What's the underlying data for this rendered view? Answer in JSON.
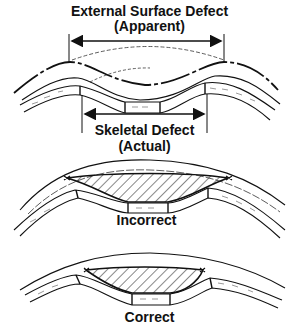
{
  "figure": {
    "panels": [
      {
        "id": "defect",
        "labels": {
          "external_title": "External Surface Defect",
          "external_sub": "(Apparent)",
          "skeletal_title": "Skeletal Defect",
          "skeletal_sub": "(Actual)"
        }
      },
      {
        "id": "incorrect",
        "caption": "Incorrect"
      },
      {
        "id": "correct",
        "caption": "Correct"
      }
    ],
    "colors": {
      "ink": "#111111",
      "background": "#ffffff"
    }
  }
}
